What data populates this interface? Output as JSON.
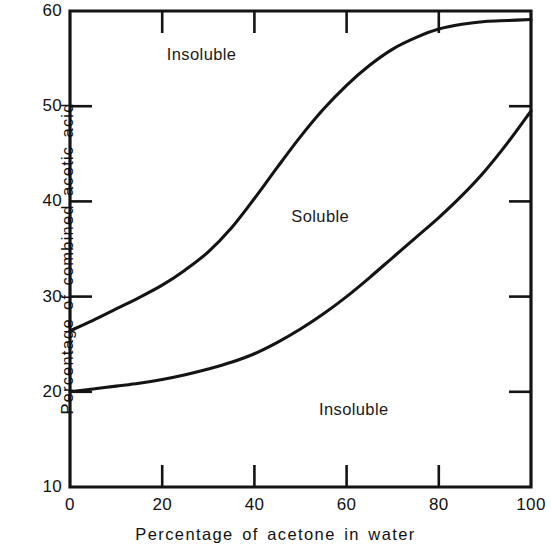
{
  "chart_data": {
    "type": "line",
    "title": "",
    "xlabel": "Percentage of acetone in water",
    "ylabel": "Percentage of combined acetic acid",
    "xlim": [
      0,
      100
    ],
    "ylim": [
      10,
      60
    ],
    "xticks": [
      0,
      20,
      40,
      60,
      80,
      100
    ],
    "yticks": [
      10,
      20,
      30,
      40,
      50,
      60
    ],
    "xtick_labels": [
      "0",
      "20",
      "40",
      "60",
      "80",
      "100"
    ],
    "ytick_labels": [
      "10",
      "20",
      "30",
      "40",
      "50",
      "60"
    ],
    "grid": false,
    "legend": "none",
    "line_color": "#141414",
    "axis_color": "#141414",
    "background": "#ffffff",
    "annotations": [
      {
        "text": "Insoluble",
        "x": 21,
        "y": 55.5,
        "region": "upper"
      },
      {
        "text": "Soluble",
        "x": 48,
        "y": 38.5,
        "region": "middle"
      },
      {
        "text": "Insoluble",
        "x": 54,
        "y": 18.2,
        "region": "lower"
      }
    ],
    "series": [
      {
        "name": "Upper solubility boundary",
        "x": [
          0,
          5,
          10,
          15,
          20,
          25,
          30,
          35,
          40,
          45,
          50,
          55,
          60,
          65,
          70,
          75,
          80,
          85,
          90,
          95,
          100
        ],
        "values": [
          26.4,
          27.5,
          28.7,
          29.9,
          31.2,
          32.8,
          34.7,
          37.2,
          40.3,
          43.6,
          46.8,
          49.7,
          52.2,
          54.3,
          56.0,
          57.2,
          58.1,
          58.6,
          58.9,
          59.0,
          59.1
        ]
      },
      {
        "name": "Lower solubility boundary",
        "x": [
          0,
          5,
          10,
          15,
          20,
          25,
          30,
          35,
          40,
          45,
          50,
          55,
          60,
          65,
          70,
          75,
          80,
          85,
          90,
          95,
          100
        ],
        "values": [
          20.0,
          20.3,
          20.6,
          20.9,
          21.3,
          21.8,
          22.4,
          23.1,
          24.0,
          25.2,
          26.6,
          28.2,
          30.0,
          32.0,
          34.1,
          36.2,
          38.3,
          40.6,
          43.2,
          46.2,
          49.5
        ]
      }
    ]
  }
}
